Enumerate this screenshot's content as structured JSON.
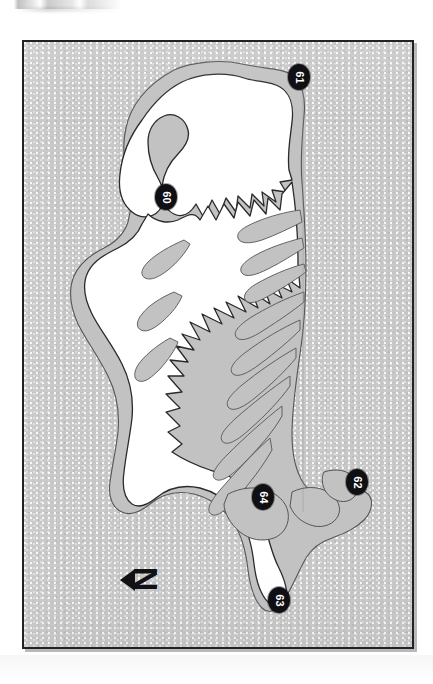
{
  "figure": {
    "type": "map",
    "orientation_note": "rotated-90-labels",
    "frame": {
      "border_color": "#222226",
      "sea_color": "#c8c8c8",
      "land_color": "#ffffff",
      "shelf_color": "#c0c0c0"
    }
  },
  "map": {
    "title": "",
    "land_label": "",
    "sea_label": "",
    "outline_color": "#2a2a2e",
    "markers": [
      {
        "id": "site-60",
        "label": "60",
        "x": 141,
        "y": 155
      },
      {
        "id": "site-61",
        "label": "61",
        "x": 274,
        "y": 35
      },
      {
        "id": "site-62",
        "label": "62",
        "x": 332,
        "y": 440
      },
      {
        "id": "site-63",
        "label": "63",
        "x": 254,
        "y": 558
      },
      {
        "id": "site-64",
        "label": "64",
        "x": 238,
        "y": 455
      }
    ]
  },
  "north_arrow": {
    "label": "N",
    "name": "north-arrow"
  }
}
